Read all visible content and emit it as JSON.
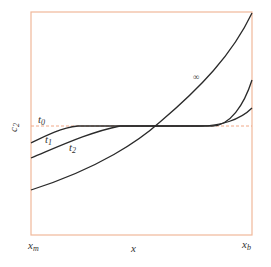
{
  "figure": {
    "frame_color": "#f0b89a",
    "curve_color": "#2a2a2a",
    "dash_color": "#f0a888"
  },
  "axes": {
    "ylabel": "c",
    "ylabel_sub": "2",
    "xlabel": "x",
    "x_left_label": "x",
    "x_left_sub": "m",
    "x_right_label": "x",
    "x_right_sub": "b"
  },
  "curves": [
    {
      "label": "t",
      "sub": "0",
      "style": "dashed"
    },
    {
      "label": "t",
      "sub": "1",
      "style": "solid"
    },
    {
      "label": "t",
      "sub": "2",
      "style": "solid"
    },
    {
      "label": "∞",
      "sub": "",
      "style": "solid"
    }
  ]
}
